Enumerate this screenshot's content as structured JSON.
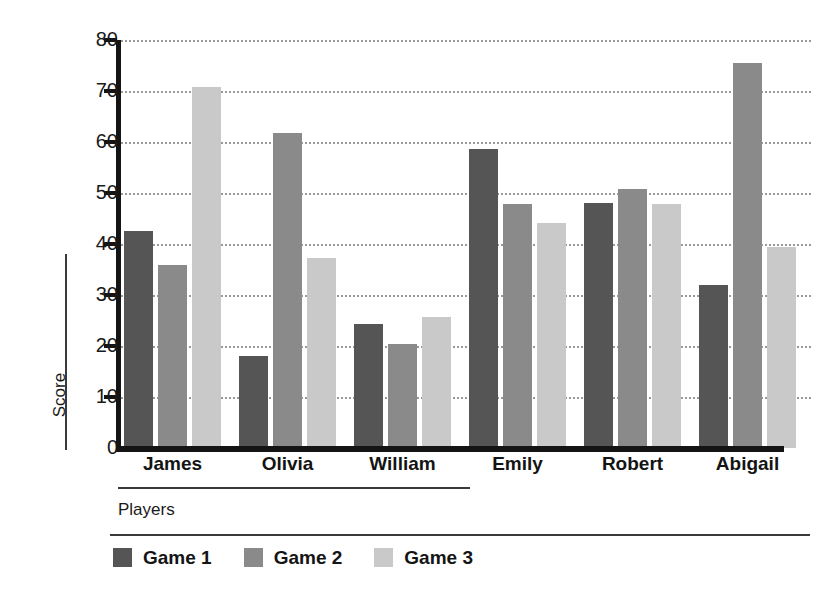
{
  "chart_data": {
    "type": "bar",
    "title": "",
    "xlabel": "Players",
    "ylabel": "Score",
    "categories": [
      "James",
      "Olivia",
      "William",
      "Emily",
      "Robert",
      "Abigail"
    ],
    "series": [
      {
        "name": "Game 1",
        "color": "#555555",
        "values": [
          42.5,
          18.0,
          24.3,
          58.6,
          48.1,
          32.0
        ]
      },
      {
        "name": "Game 2",
        "color": "#8a8a8a",
        "values": [
          35.8,
          61.8,
          20.4,
          47.9,
          50.7,
          75.5
        ]
      },
      {
        "name": "Game 3",
        "color": "#c9c9c9",
        "values": [
          70.8,
          37.2,
          25.6,
          44.2,
          47.9,
          39.5
        ]
      }
    ],
    "ylim": [
      0,
      80
    ],
    "yticks": [
      0,
      10,
      20,
      30,
      40,
      50,
      60,
      70,
      80
    ],
    "ytick_labels": [
      "0",
      "10",
      "20",
      "30",
      "40",
      "50",
      "60",
      "70",
      "80"
    ],
    "grid": true,
    "grid_axis": "y",
    "grid_style": "dotted",
    "legend_position": "bottom-left",
    "background": "#ffffff",
    "axis_color": "#141414"
  }
}
